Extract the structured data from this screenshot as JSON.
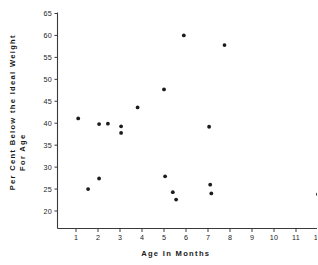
{
  "chart_data": {
    "type": "scatter",
    "title": "",
    "xlabel": "Age  In  Months",
    "ylabel_line1": "Per  Cent  Below  the  Ideal  Weight",
    "ylabel_line2": "For  Age",
    "xlim": [
      0,
      12.6
    ],
    "ylim": [
      17.5,
      65
    ],
    "xticks": [
      1,
      2,
      3,
      4,
      5,
      6,
      7,
      8,
      9,
      10,
      11,
      12
    ],
    "xticklabels": [
      "1",
      "2",
      "3",
      "4",
      "5",
      "6",
      "7",
      "8",
      "9",
      "10",
      "11",
      "12"
    ],
    "yticks": [
      20,
      25,
      30,
      35,
      40,
      45,
      50,
      55,
      60,
      65
    ],
    "yticklabels": [
      "20",
      "25",
      "30",
      "35",
      "40",
      "45",
      "50",
      "55",
      "60",
      "65"
    ],
    "grid": false,
    "legend": false,
    "marker": "filled-circle",
    "marker_color": "#1b1b1b",
    "points": [
      {
        "x": 1.1,
        "y": 41.1
      },
      {
        "x": 1.55,
        "y": 25.0
      },
      {
        "x": 2.05,
        "y": 39.8
      },
      {
        "x": 2.05,
        "y": 27.4
      },
      {
        "x": 2.45,
        "y": 39.9
      },
      {
        "x": 3.05,
        "y": 39.3
      },
      {
        "x": 3.05,
        "y": 37.8
      },
      {
        "x": 3.8,
        "y": 43.6
      },
      {
        "x": 5.0,
        "y": 47.7
      },
      {
        "x": 5.05,
        "y": 27.9
      },
      {
        "x": 5.4,
        "y": 24.3
      },
      {
        "x": 5.55,
        "y": 22.6
      },
      {
        "x": 5.9,
        "y": 60.0
      },
      {
        "x": 7.05,
        "y": 39.2
      },
      {
        "x": 7.1,
        "y": 26.0
      },
      {
        "x": 7.15,
        "y": 24.0
      },
      {
        "x": 7.75,
        "y": 57.8
      },
      {
        "x": 12.0,
        "y": 23.8
      }
    ]
  }
}
